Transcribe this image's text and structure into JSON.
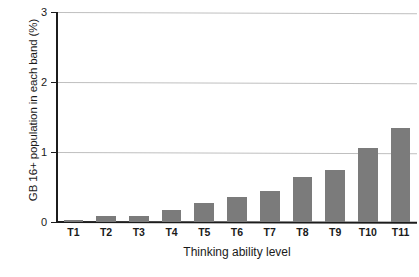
{
  "chart_data": {
    "type": "bar",
    "title": "",
    "subtitle": "",
    "xlabel": "Thinking ability level",
    "ylabel": "GB 16+ population in each band (%)",
    "categories": [
      "T1",
      "T2",
      "T3",
      "T4",
      "T5",
      "T6",
      "T7",
      "T8",
      "T9",
      "T10",
      "T11"
    ],
    "values": [
      0.03,
      0.09,
      0.08,
      0.17,
      0.27,
      0.36,
      0.45,
      0.65,
      0.74,
      1.06,
      1.35
    ],
    "series": [
      {
        "name": "GB 16+ population in each band (%)",
        "values": [
          0.03,
          0.09,
          0.08,
          0.17,
          0.27,
          0.36,
          0.45,
          0.65,
          0.74,
          1.06,
          1.35
        ]
      }
    ],
    "ylim": [
      0,
      3
    ],
    "y_ticks": [
      0,
      1,
      2,
      3
    ],
    "y_tick_labels": [
      "0",
      "1",
      "2",
      "3"
    ],
    "grid": true,
    "grid_axis": "y",
    "legend": false,
    "legend_position": "none",
    "bar_color": "#7b7b7b",
    "gridline_color": "#bfbfbf",
    "axis_color": "#1c1c1c",
    "background_color": "#ffffff",
    "annotations": []
  }
}
